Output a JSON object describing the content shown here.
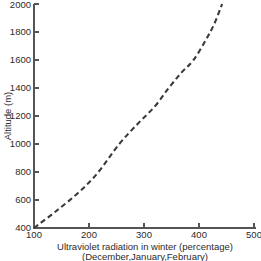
{
  "chart_data": {
    "type": "line",
    "title": "",
    "xlabel": "Ultraviolet radiation in winter (percentage)",
    "xlabel_sub": "(December,January,February)",
    "ylabel": "Altitude (m)",
    "xlim": [
      100,
      500
    ],
    "ylim": [
      400,
      2000
    ],
    "xticks": [
      100,
      200,
      300,
      400,
      500
    ],
    "xtick_labels": [
      "100",
      "200",
      "300",
      "400",
      "500"
    ],
    "yticks": [
      400,
      600,
      800,
      1000,
      1200,
      1400,
      1600,
      1800,
      2000
    ],
    "ytick_labels": [
      "400",
      "600",
      "800",
      "1000",
      "1200",
      "1400",
      "1600",
      "1800",
      "2000"
    ],
    "grid": false,
    "legend": "none",
    "series": [
      {
        "name": "Ultraviolet radiation vs altitude",
        "style": "dashed",
        "color": "#3a3a3c",
        "x": [
          100,
          140,
          180,
          215,
          255,
          290,
          320,
          345,
          368,
          390,
          412,
          428,
          442
        ],
        "y": [
          400,
          520,
          650,
          790,
          1000,
          1150,
          1270,
          1400,
          1510,
          1600,
          1740,
          1860,
          2000
        ]
      }
    ]
  },
  "axis": {
    "y_title": "Altitude (m)",
    "x_title_line1": "Ultraviolet radiation in winter (percentage)",
    "x_title_line2": "(December,January,February)"
  },
  "colors": {
    "curve": "#3a3a3c",
    "axis": "#555555",
    "text": "#2b2b2b",
    "background": "#ffffff"
  }
}
